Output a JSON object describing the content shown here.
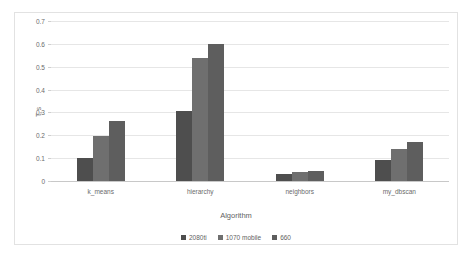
{
  "chart_data": {
    "type": "bar",
    "title": "",
    "subtitle": "",
    "xlabel": "Algorithm",
    "ylabel": "T, s",
    "categories": [
      "k_means",
      "hierarchy",
      "neighbors",
      "my_dbscan"
    ],
    "series": [
      {
        "name": "2080ti",
        "color": "#4e4e4e",
        "values": [
          0.101,
          0.305,
          0.032,
          0.092
        ]
      },
      {
        "name": "1070 mobile",
        "color": "#6f6f6f",
        "values": [
          0.195,
          0.54,
          0.041,
          0.14
        ]
      },
      {
        "name": "660",
        "color": "#5e5e5e",
        "values": [
          0.264,
          0.6,
          0.046,
          0.17
        ]
      }
    ],
    "ylim": [
      0,
      0.7
    ],
    "ytick_values": [
      0,
      0.1,
      0.2,
      0.3,
      0.4,
      0.5,
      0.6,
      0.7
    ],
    "ytick_labels": [
      "0",
      "0.1",
      "0.2",
      "0.3",
      "0.4",
      "0.5",
      "0.6",
      "0.7"
    ],
    "grid": true,
    "grid_axis": "y",
    "legend_position": "bottom",
    "bar_orientation": "vertical",
    "grouping": "clustered"
  },
  "colors": {
    "frame_border": "#e2e2e2",
    "gridline": "#e6e6e6",
    "axis_line": "#c8c8c8",
    "text": "#6b6b6b",
    "background": "#ffffff"
  }
}
